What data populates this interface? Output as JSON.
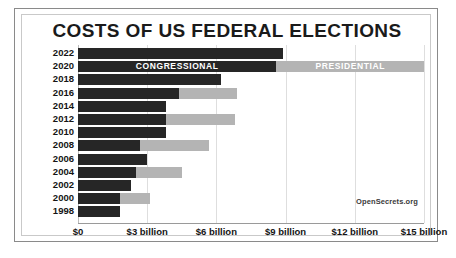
{
  "chart": {
    "title": "COSTS OF US FEDERAL ELECTIONS",
    "source_credit": "OpenSecrets.org"
  },
  "chart_data": {
    "type": "bar",
    "orientation": "horizontal",
    "stacked": true,
    "title": "COSTS OF US FEDERAL ELECTIONS",
    "xlabel": "",
    "ylabel": "",
    "xlim": [
      0,
      15
    ],
    "unit": "billion USD",
    "grid": true,
    "legend_position": "inline-on-bars",
    "categories": [
      "2022",
      "2020",
      "2018",
      "2016",
      "2014",
      "2012",
      "2010",
      "2008",
      "2006",
      "2004",
      "2002",
      "2000",
      "1998"
    ],
    "series": [
      {
        "name": "CONGRESSIONAL",
        "color": "#262626",
        "values": [
          8.9,
          8.6,
          6.2,
          4.4,
          3.8,
          3.8,
          3.8,
          2.7,
          3.0,
          2.5,
          2.3,
          1.8,
          1.8
        ]
      },
      {
        "name": "PRESIDENTIAL",
        "color": "#b4b4b4",
        "values": [
          0,
          6.4,
          0,
          2.5,
          0,
          3.0,
          0,
          3.0,
          0,
          2.0,
          0,
          1.3,
          0
        ]
      }
    ],
    "xticks": [
      0,
      3,
      6,
      9,
      12,
      15
    ],
    "xticklabels": [
      "$0",
      "$3 billion",
      "$6 billion",
      "$9 billion",
      "$12 billion",
      "$15 billion"
    ],
    "annotations": [
      {
        "text": "CONGRESSIONAL",
        "on_category": "2020",
        "series": "CONGRESSIONAL"
      },
      {
        "text": "PRESIDENTIAL",
        "on_category": "2020",
        "series": "PRESIDENTIAL"
      },
      {
        "text": "OpenSecrets.org",
        "position": "bottom-right"
      }
    ]
  }
}
